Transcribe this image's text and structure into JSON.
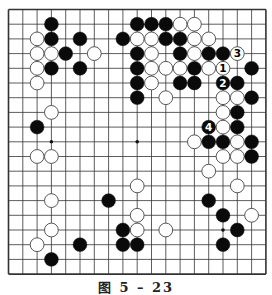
{
  "figure": {
    "caption": "图 5 – 23",
    "board_size": 19,
    "colors": {
      "black": "#0a0a0a",
      "white": "#ffffff",
      "line": "#333333",
      "background": "#ffffff"
    }
  },
  "board": {
    "hoshi": [
      [
        3,
        9
      ],
      [
        9,
        9
      ],
      [
        15,
        15
      ],
      [
        3,
        3
      ],
      [
        9,
        3
      ],
      [
        15,
        3
      ],
      [
        3,
        15
      ],
      [
        9,
        15
      ],
      [
        15,
        9
      ]
    ],
    "visible_hoshi": [
      [
        3,
        9
      ],
      [
        9,
        9
      ],
      [
        15,
        15
      ]
    ],
    "stones": [
      {
        "c": 3,
        "r": 1,
        "color": "black"
      },
      {
        "c": 9,
        "r": 1,
        "color": "black"
      },
      {
        "c": 10,
        "r": 1,
        "color": "black"
      },
      {
        "c": 11,
        "r": 1,
        "color": "black"
      },
      {
        "c": 12,
        "r": 1,
        "color": "white"
      },
      {
        "c": 13,
        "r": 1,
        "color": "white"
      },
      {
        "c": 2,
        "r": 2,
        "color": "white"
      },
      {
        "c": 3,
        "r": 2,
        "color": "black"
      },
      {
        "c": 5,
        "r": 2,
        "color": "black"
      },
      {
        "c": 8,
        "r": 2,
        "color": "black"
      },
      {
        "c": 9,
        "r": 2,
        "color": "white"
      },
      {
        "c": 10,
        "r": 2,
        "color": "white"
      },
      {
        "c": 11,
        "r": 2,
        "color": "black"
      },
      {
        "c": 12,
        "r": 2,
        "color": "black"
      },
      {
        "c": 13,
        "r": 2,
        "color": "white"
      },
      {
        "c": 14,
        "r": 2,
        "color": "white"
      },
      {
        "c": 2,
        "r": 3,
        "color": "white"
      },
      {
        "c": 3,
        "r": 3,
        "color": "white"
      },
      {
        "c": 4,
        "r": 3,
        "color": "black"
      },
      {
        "c": 6,
        "r": 3,
        "color": "white"
      },
      {
        "c": 9,
        "r": 3,
        "color": "black"
      },
      {
        "c": 10,
        "r": 3,
        "color": "white"
      },
      {
        "c": 12,
        "r": 3,
        "color": "black"
      },
      {
        "c": 13,
        "r": 3,
        "color": "white"
      },
      {
        "c": 14,
        "r": 3,
        "color": "black"
      },
      {
        "c": 15,
        "r": 3,
        "color": "black"
      },
      {
        "c": 16,
        "r": 3,
        "color": "white",
        "label": "3"
      },
      {
        "c": 2,
        "r": 4,
        "color": "white"
      },
      {
        "c": 3,
        "r": 4,
        "color": "black"
      },
      {
        "c": 5,
        "r": 4,
        "color": "black"
      },
      {
        "c": 9,
        "r": 4,
        "color": "black"
      },
      {
        "c": 10,
        "r": 4,
        "color": "white"
      },
      {
        "c": 11,
        "r": 4,
        "color": "white"
      },
      {
        "c": 12,
        "r": 4,
        "color": "white"
      },
      {
        "c": 13,
        "r": 4,
        "color": "black"
      },
      {
        "c": 14,
        "r": 4,
        "color": "white"
      },
      {
        "c": 15,
        "r": 4,
        "color": "white",
        "label": "1"
      },
      {
        "c": 17,
        "r": 4,
        "color": "black"
      },
      {
        "c": 2,
        "r": 5,
        "color": "white"
      },
      {
        "c": 9,
        "r": 5,
        "color": "black"
      },
      {
        "c": 10,
        "r": 5,
        "color": "white"
      },
      {
        "c": 12,
        "r": 5,
        "color": "black"
      },
      {
        "c": 13,
        "r": 5,
        "color": "black"
      },
      {
        "c": 15,
        "r": 5,
        "color": "black",
        "label": "2"
      },
      {
        "c": 16,
        "r": 5,
        "color": "black"
      },
      {
        "c": 9,
        "r": 6,
        "color": "black"
      },
      {
        "c": 11,
        "r": 6,
        "color": "white"
      },
      {
        "c": 15,
        "r": 6,
        "color": "white"
      },
      {
        "c": 16,
        "r": 6,
        "color": "white"
      },
      {
        "c": 17,
        "r": 6,
        "color": "black"
      },
      {
        "c": 3,
        "r": 7,
        "color": "white"
      },
      {
        "c": 15,
        "r": 7,
        "color": "white"
      },
      {
        "c": 16,
        "r": 7,
        "color": "black"
      },
      {
        "c": 2,
        "r": 8,
        "color": "black"
      },
      {
        "c": 14,
        "r": 8,
        "color": "black",
        "label": "4"
      },
      {
        "c": 15,
        "r": 8,
        "color": "white"
      },
      {
        "c": 16,
        "r": 8,
        "color": "black"
      },
      {
        "c": 13,
        "r": 9,
        "color": "white"
      },
      {
        "c": 14,
        "r": 9,
        "color": "black"
      },
      {
        "c": 15,
        "r": 9,
        "color": "black"
      },
      {
        "c": 16,
        "r": 9,
        "color": "white"
      },
      {
        "c": 17,
        "r": 9,
        "color": "black"
      },
      {
        "c": 2,
        "r": 10,
        "color": "white"
      },
      {
        "c": 3,
        "r": 10,
        "color": "white"
      },
      {
        "c": 15,
        "r": 10,
        "color": "white"
      },
      {
        "c": 16,
        "r": 10,
        "color": "white"
      },
      {
        "c": 17,
        "r": 10,
        "color": "black"
      },
      {
        "c": 14,
        "r": 11,
        "color": "white"
      },
      {
        "c": 9,
        "r": 12,
        "color": "white"
      },
      {
        "c": 16,
        "r": 12,
        "color": "white"
      },
      {
        "c": 3,
        "r": 13,
        "color": "white"
      },
      {
        "c": 7,
        "r": 13,
        "color": "black"
      },
      {
        "c": 14,
        "r": 13,
        "color": "black"
      },
      {
        "c": 9,
        "r": 14,
        "color": "white"
      },
      {
        "c": 15,
        "r": 14,
        "color": "black"
      },
      {
        "c": 17,
        "r": 14,
        "color": "white"
      },
      {
        "c": 3,
        "r": 15,
        "color": "white"
      },
      {
        "c": 8,
        "r": 15,
        "color": "black"
      },
      {
        "c": 9,
        "r": 15,
        "color": "white"
      },
      {
        "c": 11,
        "r": 15,
        "color": "white"
      },
      {
        "c": 16,
        "r": 15,
        "color": "black"
      },
      {
        "c": 2,
        "r": 16,
        "color": "white"
      },
      {
        "c": 5,
        "r": 16,
        "color": "black"
      },
      {
        "c": 8,
        "r": 16,
        "color": "black"
      },
      {
        "c": 9,
        "r": 16,
        "color": "black"
      },
      {
        "c": 15,
        "r": 16,
        "color": "black"
      },
      {
        "c": 3,
        "r": 17,
        "color": "black"
      }
    ]
  }
}
